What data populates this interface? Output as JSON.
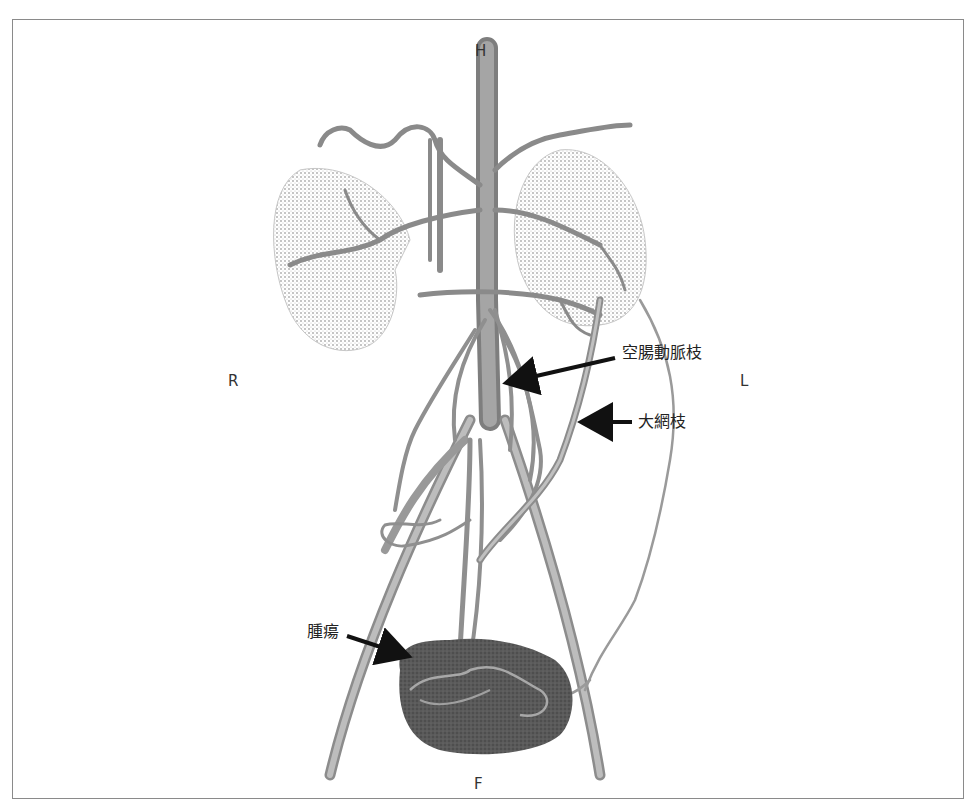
{
  "figure": {
    "orientation_labels": {
      "head": "H",
      "foot": "F",
      "right": "R",
      "left": "L"
    },
    "annotations": [
      {
        "id": "jejunal",
        "label": "空腸動脈枝",
        "meaning": "jejunal artery branch"
      },
      {
        "id": "omental",
        "label": "大網枝",
        "meaning": "omental branch"
      },
      {
        "id": "tumor",
        "label": "腫瘍",
        "meaning": "tumor"
      }
    ],
    "colors": {
      "frame": "#8a8a8a",
      "vessel": "#9a9a9a",
      "vessel_dark": "#6e6e6e",
      "kidney_shade": "#c8c8c8",
      "tumor": "#555555",
      "arrow": "#111111",
      "text": "#222222"
    }
  }
}
